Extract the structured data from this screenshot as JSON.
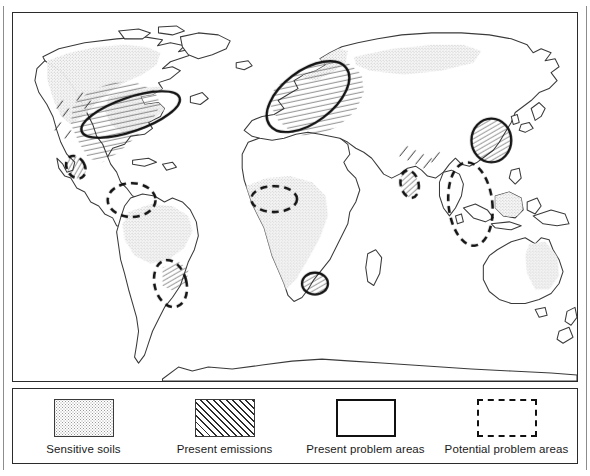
{
  "figure": {
    "type": "thematic world map",
    "topic": "Acid deposition: sensitive soils, present emissions, present and potential problem areas"
  },
  "legend": {
    "items": [
      {
        "key": "sensitive-soils",
        "label": "Sensitive soils",
        "swatch": "stipple-fill-box",
        "swatch_style": "stipple"
      },
      {
        "key": "present-emissions",
        "label": "Present emissions",
        "swatch": "diagonal-hatch-box",
        "swatch_style": "hatch"
      },
      {
        "key": "present-problem-areas",
        "label": "Present problem areas",
        "swatch": "solid-outline-box",
        "swatch_style": "solid"
      },
      {
        "key": "potential-problem-areas",
        "label": "Potential problem areas",
        "swatch": "dashed-outline-box",
        "swatch_style": "dashed"
      }
    ]
  },
  "map": {
    "projection_note": "cylindrical world map, coastlines only, no graticule",
    "colors": {
      "coastline": "#3a3a3a",
      "stipple": "#9a9a9a",
      "hatch": "#2b2b2b",
      "present_outline": "#111111",
      "potential_outline": "#111111",
      "frame": "#2b2b2b",
      "background": "#ffffff"
    },
    "sensitive_soils_regions": [
      "Northern Canada and Canadian Shield",
      "Alaska / northwestern North America",
      "Eastern United States",
      "Northern Europe / Fennoscandia",
      "Siberia / northern Russia",
      "Amazon basin, South America",
      "Central and southern Africa",
      "Southeast Asia / Indonesia",
      "Eastern Australia"
    ],
    "present_emissions_regions": [
      "Eastern North America",
      "Central and western Europe",
      "Western United States",
      "Central Asia",
      "Southeastern Brazil",
      "Persian Gulf"
    ],
    "present_problem_areas": [
      "Northeastern North America",
      "Northern and central Europe",
      "Eastern China",
      "South Africa (Highveld)"
    ],
    "potential_problem_areas": [
      "Central Mexico",
      "Northern South America (Venezuela / Colombia)",
      "Southeastern Brazil",
      "West Africa (Gulf of Guinea / Nigeria)",
      "Persian Gulf",
      "Southeast Asia (Thailand / Indochina)"
    ]
  }
}
